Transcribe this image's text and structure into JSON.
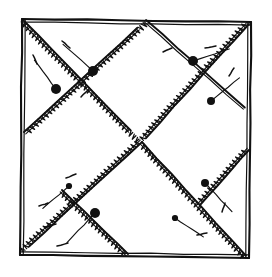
{
  "figure": {
    "title": "Hand-drawn quilt block diagram",
    "canvas": {
      "width": 272,
      "height": 277
    },
    "ink_color": "#111111",
    "paper_color": "#ffffff"
  },
  "chart_data": {
    "type": "diagram",
    "title": "Hand-drawn quilt block diagram",
    "border": {
      "name": "square-block-outline",
      "style": "double-stroke freehand square",
      "points": [
        [
          22,
          19
        ],
        [
          251,
          22
        ],
        [
          249,
          258
        ],
        [
          20,
          255
        ]
      ]
    },
    "seams": [
      {
        "name": "seam-top-left-to-center",
        "from": [
          23,
          20
        ],
        "to": [
          142,
          142
        ],
        "hatch": "zigzag"
      },
      {
        "name": "seam-top-right-to-center",
        "from": [
          249,
          24
        ],
        "to": [
          142,
          142
        ],
        "hatch": "zigzag"
      },
      {
        "name": "seam-center-to-bottom-left",
        "from": [
          142,
          142
        ],
        "to": [
          22,
          253
        ],
        "hatch": "zigzag"
      },
      {
        "name": "seam-center-to-bottom-right",
        "from": [
          142,
          142
        ],
        "to": [
          246,
          256
        ],
        "hatch": "zigzag"
      },
      {
        "name": "seam-left-edge-to-upper-right",
        "from": [
          24,
          132
        ],
        "to": [
          146,
          20
        ],
        "hatch": "zigzag"
      },
      {
        "name": "seam-upper-left-to-right-edge",
        "from": [
          146,
          20
        ],
        "to": [
          250,
          112
        ],
        "hatch": "plain"
      },
      {
        "name": "seam-lower-left-to-bottom",
        "from": [
          62,
          190
        ],
        "to": [
          128,
          254
        ],
        "hatch": "zigzag"
      },
      {
        "name": "seam-right-edge-to-bottom",
        "from": [
          249,
          150
        ],
        "to": [
          200,
          205
        ],
        "hatch": "zigzag"
      }
    ],
    "pins": [
      {
        "name": "pin-1",
        "head": [
          93,
          71
        ],
        "tail": [
          75,
          55
        ],
        "size": "large"
      },
      {
        "name": "pin-2",
        "head": [
          56,
          89
        ],
        "tail": [
          44,
          73
        ],
        "size": "large"
      },
      {
        "name": "pin-3",
        "head": [
          193,
          61
        ],
        "tail": [
          214,
          54
        ],
        "size": "large"
      },
      {
        "name": "pin-4",
        "head": [
          211,
          101
        ],
        "tail": [
          227,
          88
        ],
        "size": "medium"
      },
      {
        "name": "pin-5",
        "head": [
          69,
          186
        ],
        "tail": [
          55,
          198
        ],
        "size": "small"
      },
      {
        "name": "pin-6",
        "head": [
          95,
          213
        ],
        "tail": [
          78,
          231
        ],
        "size": "large"
      },
      {
        "name": "pin-7",
        "head": [
          205,
          183
        ],
        "tail": [
          221,
          200
        ],
        "size": "medium"
      },
      {
        "name": "pin-8",
        "head": [
          175,
          218
        ],
        "tail": [
          190,
          228
        ],
        "size": "small"
      }
    ],
    "dashes": [
      {
        "name": "dash-1",
        "from": [
          62,
          41
        ],
        "to": [
          70,
          48
        ]
      },
      {
        "name": "dash-2",
        "from": [
          33,
          55
        ],
        "to": [
          37,
          64
        ]
      },
      {
        "name": "dash-3",
        "from": [
          205,
          48
        ],
        "to": [
          216,
          46
        ]
      },
      {
        "name": "dash-4",
        "from": [
          229,
          76
        ],
        "to": [
          234,
          68
        ]
      },
      {
        "name": "dash-5",
        "from": [
          66,
          178
        ],
        "to": [
          76,
          174
        ]
      },
      {
        "name": "dash-6",
        "from": [
          39,
          206
        ],
        "to": [
          48,
          203
        ]
      },
      {
        "name": "dash-7",
        "from": [
          45,
          227
        ],
        "to": [
          56,
          224
        ]
      },
      {
        "name": "dash-8",
        "from": [
          57,
          246
        ],
        "to": [
          68,
          243
        ]
      },
      {
        "name": "dash-9",
        "from": [
          197,
          235
        ],
        "to": [
          207,
          233
        ]
      },
      {
        "name": "dash-10",
        "from": [
          222,
          212
        ],
        "to": [
          225,
          203
        ]
      },
      {
        "name": "dash-11",
        "from": [
          81,
          97
        ],
        "to": [
          88,
          90
        ]
      },
      {
        "name": "dash-12",
        "from": [
          163,
          52
        ],
        "to": [
          172,
          48
        ]
      }
    ]
  }
}
